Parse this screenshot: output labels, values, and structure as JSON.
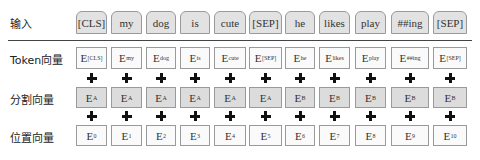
{
  "rows": {
    "input": {
      "label": "输入",
      "items": [
        "[CLS]",
        "my",
        "dog",
        "is",
        "cute",
        "[SEP]",
        "he",
        "likes",
        "play",
        "##ing",
        "[SEP]"
      ]
    },
    "token": {
      "label": "Token向量",
      "prefix": "E",
      "subs": [
        "[CLS]",
        "my",
        "dog",
        "is",
        "cute",
        "[SEP]",
        "he",
        "likes",
        "play",
        "##ing",
        "[SEP]"
      ]
    },
    "segment": {
      "label": "分割向量",
      "prefix": "E",
      "subs": [
        "A",
        "A",
        "A",
        "A",
        "A",
        "A",
        "B",
        "B",
        "B",
        "B",
        "B"
      ]
    },
    "position": {
      "label": "位置向量",
      "prefix": "E",
      "subs": [
        "0",
        "1",
        "2",
        "3",
        "4",
        "5",
        "6",
        "7",
        "8",
        "9",
        "10"
      ]
    }
  },
  "operator": "+",
  "columns": [
    {
      "x": 76,
      "w": 31
    },
    {
      "x": 111,
      "w": 31
    },
    {
      "x": 146,
      "w": 30
    },
    {
      "x": 180,
      "w": 30
    },
    {
      "x": 214,
      "w": 32
    },
    {
      "x": 249,
      "w": 33
    },
    {
      "x": 285,
      "w": 30
    },
    {
      "x": 319,
      "w": 31
    },
    {
      "x": 355,
      "w": 31
    },
    {
      "x": 391,
      "w": 38
    },
    {
      "x": 433,
      "w": 34
    }
  ]
}
